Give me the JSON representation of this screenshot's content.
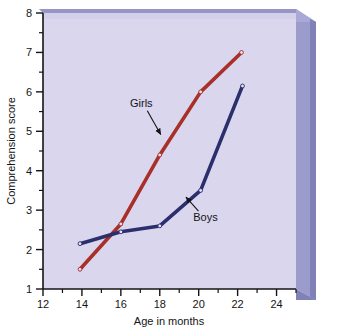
{
  "chart_data": {
    "type": "line",
    "title": "",
    "xlabel": "Age in months",
    "ylabel": "Comprehension score",
    "xlim": [
      12,
      25
    ],
    "ylim": [
      1,
      8
    ],
    "xticks": [
      12,
      14,
      16,
      18,
      20,
      22,
      24
    ],
    "yticks": [
      1,
      2,
      3,
      4,
      5,
      6,
      7,
      8
    ],
    "minor_xticks": [
      13,
      15,
      17,
      19,
      21,
      23
    ],
    "minor_yticks": [
      1.5,
      2.5,
      3.5,
      4.5,
      5.5,
      6.5,
      7.5
    ],
    "grid": false,
    "legend_position": "inline-annotations",
    "series": [
      {
        "name": "Girls",
        "color": "#a83028",
        "x": [
          13.9,
          16.0,
          18.0,
          20.1,
          22.2
        ],
        "values": [
          1.5,
          2.65,
          4.4,
          6.0,
          7.0
        ]
      },
      {
        "name": "Boys",
        "color": "#2b2f6b",
        "x": [
          13.9,
          16.0,
          18.0,
          20.1,
          22.25
        ],
        "values": [
          2.15,
          2.45,
          2.6,
          3.5,
          6.15
        ]
      }
    ],
    "annotations": [
      {
        "text": "Girls",
        "x": 17.05,
        "y": 5.62,
        "arrow_to_x": 18.05,
        "arrow_to_y": 4.92
      },
      {
        "text": "Boys",
        "x": 20.35,
        "y": 2.72,
        "arrow_to_x": 19.35,
        "arrow_to_y": 3.33
      }
    ],
    "xtick_labels": [
      "12",
      "14",
      "16",
      "18",
      "20",
      "22",
      "24"
    ],
    "ytick_labels": [
      "1",
      "2",
      "3",
      "4",
      "5",
      "6",
      "7",
      "8"
    ],
    "colors": {
      "plot_background": "#d9d6ee",
      "bevel_side": "#9b9ccb",
      "bevel_top": "#aeaddb",
      "bevel_edge": "#8a8bc0",
      "axis": "#141414",
      "page_background": "#ffffff"
    }
  }
}
